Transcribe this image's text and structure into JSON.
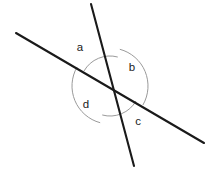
{
  "figure": {
    "width": 216,
    "height": 174,
    "background_color": "#ffffff",
    "line_color": "#1a1a1a",
    "arc_color": "#9a9a9a",
    "label_color": "#1a1a1a",
    "intersection": {
      "x": 110,
      "y": 86
    }
  },
  "lines": [
    {
      "name": "shallow-line",
      "description": "line running from upper-left to lower-right",
      "x1": 16,
      "y1": 33,
      "x2": 204,
      "y2": 143
    },
    {
      "name": "steep-line",
      "description": "line running from top to bottom",
      "x1": 91,
      "y1": 4,
      "x2": 134,
      "y2": 166
    }
  ],
  "angles": [
    {
      "id": "a",
      "label": "a",
      "label_x": 80,
      "label_y": 48,
      "arc_radius": 30,
      "arc_start_deg": 210,
      "arc_end_deg": 285,
      "position": "upper-left"
    },
    {
      "id": "b",
      "label": "b",
      "label_x": 132,
      "label_y": 68,
      "arc_radius": 38,
      "arc_start_deg": 285,
      "arc_end_deg": 30,
      "position": "right"
    },
    {
      "id": "c",
      "label": "c",
      "label_x": 138,
      "label_y": 122,
      "arc_radius": 30,
      "arc_start_deg": 30,
      "arc_end_deg": 105,
      "position": "lower-right"
    },
    {
      "id": "d",
      "label": "d",
      "label_x": 86,
      "label_y": 105,
      "arc_radius": 38,
      "arc_start_deg": 105,
      "arc_end_deg": 210,
      "position": "left"
    }
  ]
}
